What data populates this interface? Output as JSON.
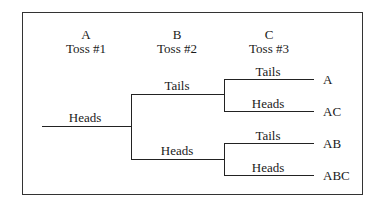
{
  "columns": [
    {
      "letter": "A",
      "label": "Toss #1"
    },
    {
      "letter": "B",
      "label": "Toss #2"
    },
    {
      "letter": "C",
      "label": "Toss #3"
    }
  ],
  "tree": {
    "root": "Heads",
    "level2": [
      "Tails",
      "Heads"
    ],
    "level3": [
      "Tails",
      "Heads",
      "Tails",
      "Heads"
    ],
    "outcomes": [
      "A",
      "AC",
      "AB",
      "ABC"
    ]
  }
}
